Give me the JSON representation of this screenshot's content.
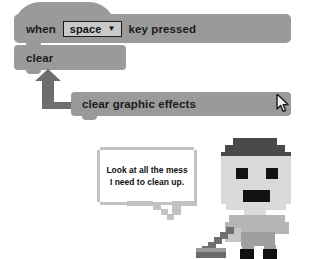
{
  "app": {
    "kind": "scratch-block-editor-illustration",
    "background": "#ffffff"
  },
  "colors": {
    "block_fill": "#9a9a9a",
    "block_text": "#1a1a1a",
    "dropdown_fill": "#c9c9c9",
    "dropdown_border": "#1c1c1c",
    "arrow_fill": "#6e6e6e",
    "bubble_border": "#c2c2c2",
    "bubble_fill": "#ffffff",
    "skin": "#d9d9d9",
    "hair": "#4a4a4a",
    "eye": "#111111",
    "shirt": "#b5b5b5",
    "pants": "#9f9f9f",
    "shoe": "#111111",
    "broom": "#8c8c8c"
  },
  "blocks": [
    {
      "id": "when-key-pressed",
      "type": "hat",
      "label_before": "when",
      "dropdown": {
        "value": "space",
        "caret": "chevron-down-icon",
        "options": [
          "space"
        ]
      },
      "label_after": "key pressed"
    },
    {
      "id": "clear",
      "type": "stack",
      "label": "clear"
    },
    {
      "id": "clear-graphic-effects",
      "type": "stack",
      "label": "clear graphic effects"
    }
  ],
  "annotation": {
    "arrow": {
      "name": "elbow-arrow-up",
      "direction": "up-left",
      "from_block": "clear-graphic-effects",
      "to_block": "clear"
    },
    "cursor": {
      "name": "mouse-pointer",
      "over_block": "clear-graphic-effects"
    }
  },
  "speech_bubble": {
    "line1": "Look at all the mess",
    "line2": "I need to clean up.",
    "tail_direction": "down-right"
  },
  "character": {
    "name": "pixel-boy-with-broom",
    "holds": "broom"
  }
}
